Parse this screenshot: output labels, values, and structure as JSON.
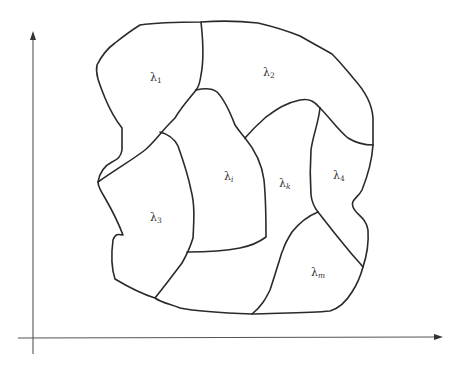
{
  "diagram": {
    "type": "partition-of-region",
    "axes": {
      "x_axis": {
        "label": "",
        "arrow": true
      },
      "y_axis": {
        "label": "",
        "arrow": true
      }
    },
    "regions": [
      {
        "id": "r1",
        "symbol": "λ",
        "subscript": "1",
        "italic_subscript": false
      },
      {
        "id": "r2",
        "symbol": "λ",
        "subscript": "2",
        "italic_subscript": false
      },
      {
        "id": "ri",
        "symbol": "λ",
        "subscript": "i",
        "italic_subscript": true
      },
      {
        "id": "rk",
        "symbol": "λ",
        "subscript": "k",
        "italic_subscript": true
      },
      {
        "id": "r4",
        "symbol": "λ",
        "subscript": "4",
        "italic_subscript": false
      },
      {
        "id": "r3",
        "symbol": "λ",
        "subscript": "3",
        "italic_subscript": false
      },
      {
        "id": "rm",
        "symbol": "λ",
        "subscript": "m",
        "italic_subscript": true
      }
    ],
    "colors": {
      "stroke": "#2a2a2a",
      "axis": "#555555",
      "background": "#ffffff",
      "label": "#333333"
    }
  }
}
